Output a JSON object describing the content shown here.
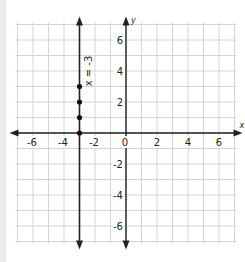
{
  "chart_data": {
    "type": "line",
    "title": "",
    "xlabel": "x",
    "ylabel": "y",
    "xlim": [
      -7,
      7
    ],
    "ylim": [
      -7,
      7
    ],
    "grid": true,
    "x_ticks": [
      -6,
      -4,
      -2,
      0,
      2,
      4,
      6
    ],
    "y_ticks": [
      6,
      4,
      2,
      -2,
      -4,
      -6
    ],
    "x_tick_labels": [
      "-6",
      "-4",
      "-2",
      "0",
      "2",
      "4",
      "6"
    ],
    "y_tick_labels": [
      "6",
      "4",
      "2",
      "-2",
      "-4",
      "-6"
    ],
    "series": [
      {
        "name": "x = -3",
        "equation": "x = -3",
        "kind": "vertical-line",
        "x": -3,
        "points": [
          [
            -3,
            0
          ],
          [
            -3,
            1
          ],
          [
            -3,
            2
          ],
          [
            -3,
            3
          ]
        ]
      }
    ],
    "annotations": [
      {
        "text": "x = -3",
        "orientation": "vertical",
        "x": -3,
        "y": 4
      }
    ]
  },
  "labels": {
    "x_axis": "x",
    "y_axis": "y",
    "line_label": "x = -3"
  }
}
